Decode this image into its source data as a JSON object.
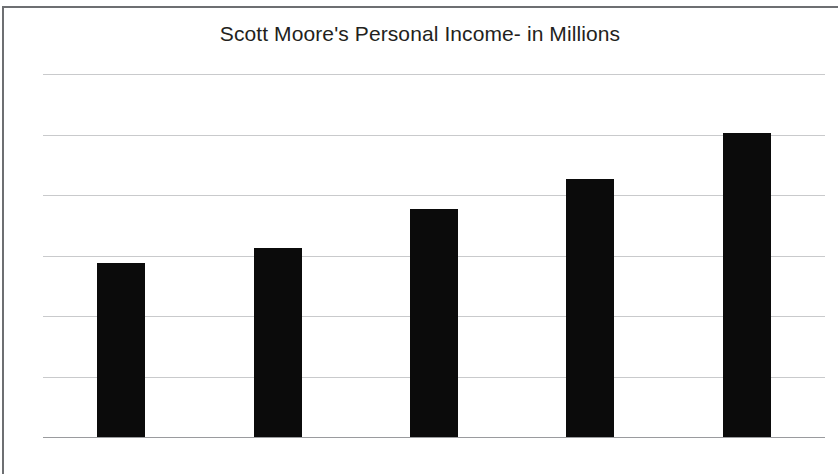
{
  "chart_data": {
    "type": "bar",
    "title": "Scott Moore's Personal Income- in Millions",
    "xlabel": "",
    "ylabel": "",
    "categories": [
      "2009",
      "2010",
      "2011",
      "2012",
      "2013"
    ],
    "values": [
      0.575,
      0.625,
      0.755,
      0.853,
      1.005
    ],
    "series": [
      {
        "name": "Personal Income",
        "values": [
          0.575,
          0.625,
          0.755,
          0.853,
          1.005
        ]
      }
    ],
    "ylim": [
      0,
      1.2
    ],
    "ytick_labels": [
      "1.2",
      "1",
      "0.8",
      "0.6",
      "0.4",
      "0.2",
      "0"
    ],
    "ytick_values": [
      1.2,
      1,
      0.8,
      0.6,
      0.4,
      0.2,
      0
    ],
    "grid": true,
    "legend": false,
    "legend_position": "none",
    "bar_color": "#0b0b0b",
    "gridline_color": "#c9cacc",
    "axis_color": "#9a9b9e",
    "text_color": "#231f20",
    "background_color": "#ffffff"
  }
}
